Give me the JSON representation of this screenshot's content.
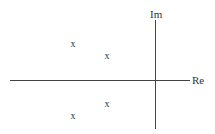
{
  "diagram": {
    "type": "pole-zero plot",
    "axes": {
      "real_label": "Re",
      "imag_label": "Im"
    },
    "marker_symbol": "x",
    "poles": [
      {
        "label": "x",
        "px": 73,
        "py": 44
      },
      {
        "label": "x",
        "px": 107,
        "py": 56
      },
      {
        "label": "x",
        "px": 107,
        "py": 104
      },
      {
        "label": "x",
        "px": 73,
        "py": 116
      }
    ]
  }
}
